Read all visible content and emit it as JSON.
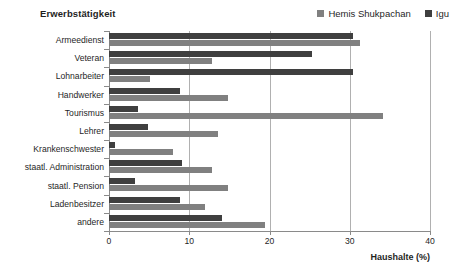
{
  "chart_data": {
    "type": "bar",
    "orientation": "horizontal",
    "title": "Erwerbstätigkeit",
    "xlabel": "Haushalte (%)",
    "ylabel": "",
    "xlim": [
      0,
      40
    ],
    "xticks": [
      0,
      10,
      20,
      30,
      40
    ],
    "xtick_labels": [
      "0",
      "10",
      "20",
      "30",
      "40"
    ],
    "grid": true,
    "grid_axis": "x",
    "legend_position": "top-right",
    "categories": [
      "Armeedienst",
      "Veteran",
      "Lohnarbeiter",
      "Handwerker",
      "Tourismus",
      "Lehrer",
      "Krankenschwester",
      "staatl. Administration",
      "staatl. Pension",
      "Ladenbesitzer",
      "andere"
    ],
    "series": [
      {
        "name": "Hemis Shukpachan",
        "color": "#808080",
        "values": [
          31.3,
          12.8,
          5.1,
          14.8,
          34.2,
          13.6,
          8.0,
          12.8,
          14.8,
          12.0,
          19.4
        ]
      },
      {
        "name": "Igu",
        "color": "#3f3f3f",
        "values": [
          30.4,
          25.3,
          30.4,
          8.8,
          3.6,
          4.9,
          0.8,
          9.1,
          3.2,
          8.8,
          14.1
        ]
      }
    ]
  },
  "colors": {
    "series_hemis": "#808080",
    "series_igu": "#3f3f3f",
    "gridline": "#b0b0b0",
    "axis": "#8a8a8a",
    "text": "#1f1f1f",
    "background": "#ffffff"
  }
}
